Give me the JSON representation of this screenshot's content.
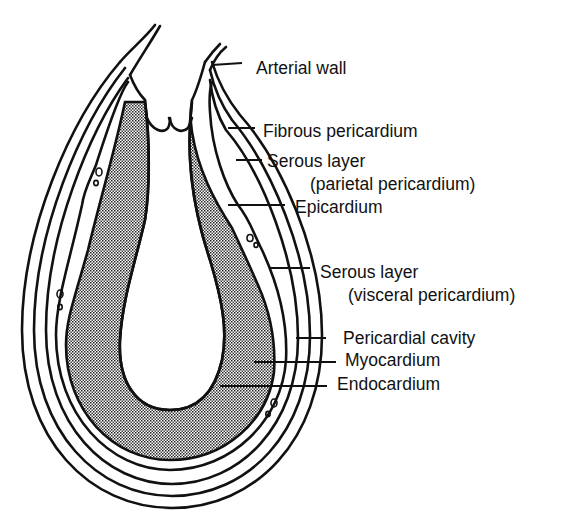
{
  "diagram": {
    "colors": {
      "stroke": "#111111",
      "background": "#ffffff",
      "myocardium_fill": "#b8b8b8"
    },
    "labels": [
      {
        "id": "arterial-wall",
        "text": "Arterial wall",
        "x": 256,
        "y": 58
      },
      {
        "id": "fibrous-pericardium",
        "text": "Fibrous pericardium",
        "x": 263,
        "y": 121
      },
      {
        "id": "serous-layer-parietal",
        "text": "Serous layer",
        "x": 267,
        "y": 151
      },
      {
        "id": "parietal-pericardium",
        "text": "(parietal pericardium)",
        "x": 310,
        "y": 174
      },
      {
        "id": "epicardium",
        "text": "Epicardium",
        "x": 295,
        "y": 197
      },
      {
        "id": "serous-layer-visceral",
        "text": "Serous layer",
        "x": 320,
        "y": 262
      },
      {
        "id": "visceral-pericardium",
        "text": "(visceral pericardium)",
        "x": 348,
        "y": 285
      },
      {
        "id": "pericardial-cavity",
        "text": "Pericardial cavity",
        "x": 343,
        "y": 328
      },
      {
        "id": "myocardium",
        "text": "Myocardium",
        "x": 345,
        "y": 350
      },
      {
        "id": "endocardium",
        "text": "Endocardium",
        "x": 337,
        "y": 374
      }
    ]
  }
}
